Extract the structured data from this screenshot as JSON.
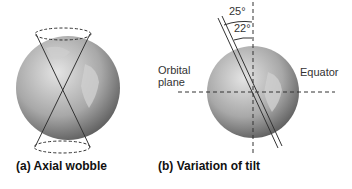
{
  "panels": [
    {
      "caption": "(a) Axial wobble"
    },
    {
      "caption": "(b) Variation of tilt",
      "labels": {
        "orbital_plane_line1": "Orbital",
        "orbital_plane_line2": "plane",
        "equator": "Equator",
        "angle_max": "25°",
        "angle_min": "22°"
      }
    }
  ],
  "colors": {
    "globe_light": "#d8d8d8",
    "globe_dark": "#5a5a5a",
    "line": "#333333"
  }
}
